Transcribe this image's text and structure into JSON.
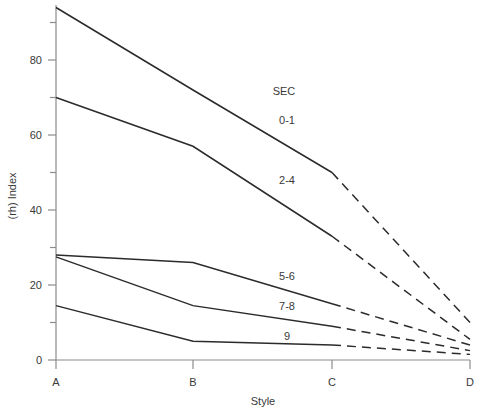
{
  "chart_data": {
    "type": "line",
    "title": "",
    "subtitle": "",
    "xlabel": "Style",
    "ylabel": "(rh) Index",
    "categories": [
      "A",
      "B",
      "C",
      "D"
    ],
    "x_positions": [
      56,
      193,
      332,
      470
    ],
    "ylim": [
      0,
      95
    ],
    "y_ticks_major": [
      0,
      20,
      40,
      60,
      80
    ],
    "y_ticks_minor": [
      10,
      30,
      50,
      70,
      90
    ],
    "grid": false,
    "legend_position": "inline-right-of-lines",
    "legend_title": "SEC",
    "series": [
      {
        "name": "0-1",
        "label": "0-1",
        "values": [
          94,
          72,
          50,
          10
        ],
        "solid_segment": [
          "A",
          "B",
          "C"
        ],
        "dashed_segment": [
          "C",
          "D"
        ],
        "label_x": 287,
        "label_y": 124
      },
      {
        "name": "2-4",
        "label": "2-4",
        "values": [
          70,
          57,
          33,
          5.5
        ],
        "solid_segment": [
          "A",
          "B",
          "C"
        ],
        "dashed_segment": [
          "C",
          "D"
        ],
        "label_x": 287,
        "label_y": 184
      },
      {
        "name": "5-6",
        "label": "5-6",
        "values": [
          28,
          26,
          15,
          4
        ],
        "solid_segment": [
          "A",
          "B",
          "C"
        ],
        "dashed_segment": [
          "C",
          "D"
        ],
        "label_x": 287,
        "label_y": 280
      },
      {
        "name": "7-8",
        "label": "7-8",
        "values": [
          27.5,
          14.5,
          9,
          2.5
        ],
        "solid_segment": [
          "A",
          "B",
          "C"
        ],
        "dashed_segment": [
          "C",
          "D"
        ],
        "label_x": 287,
        "label_y": 310
      },
      {
        "name": "9",
        "label": "9",
        "values": [
          14.5,
          5,
          4,
          1.5
        ],
        "solid_segment": [
          "A",
          "B",
          "C"
        ],
        "dashed_segment": [
          "C",
          "D"
        ],
        "label_x": 287,
        "label_y": 340
      }
    ],
    "legend_title_x": 284,
    "legend_title_y": 95,
    "y_tick_labels": [
      "0",
      "20",
      "40",
      "60",
      "80"
    ],
    "x_tick_labels": [
      "A",
      "B",
      "C",
      "D"
    ],
    "axis_color": "#8c8c8c",
    "line_color": "#2b2b2b",
    "text_color": "#3a3a3a"
  }
}
